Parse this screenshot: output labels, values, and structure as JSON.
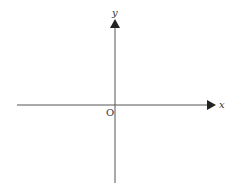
{
  "diagram": {
    "type": "cartesian-axes",
    "x_axis_label": "x",
    "y_axis_label": "y",
    "origin_label": "O",
    "colors": {
      "axis": "#555555",
      "background": "#ffffff"
    }
  }
}
